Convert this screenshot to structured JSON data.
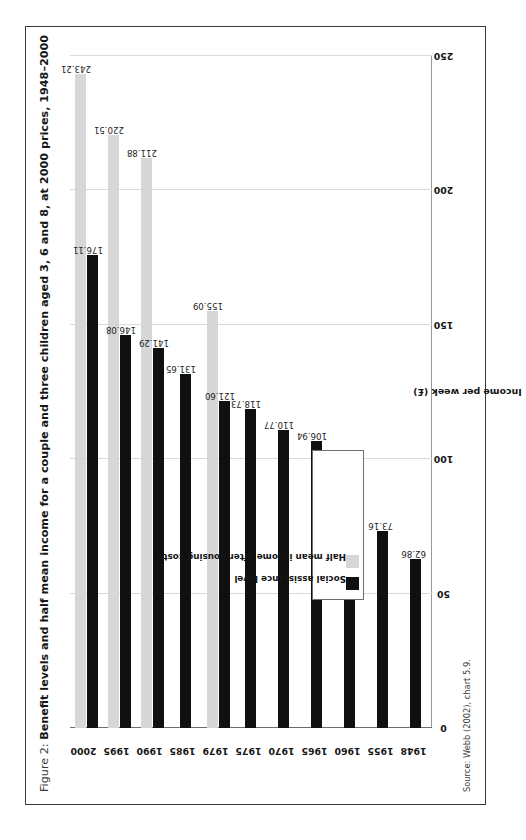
{
  "figure": {
    "label_prefix": "Figure 2: ",
    "title": "Benefit levels and half mean income for a couple and three children aged 3, 6 and 8, at 2000 prices, 1948–2000",
    "full_title": "Figure 2: Benefit levels and half mean income for a couple and three children aged 3, 6 and 8, at 2000 prices, 1948–2000",
    "source": "Source: Webb (2002), chart 5.9."
  },
  "colors": {
    "series_dark": "#101010",
    "series_light": "#d7d7d7",
    "frame_border": "#3a3a3a",
    "axis_line": "#6d6d6d",
    "gridline": "#d9d9d9",
    "text": "#151515",
    "background": "#ffffff"
  },
  "legend": {
    "position": "inside-left",
    "entries": [
      {
        "label": "Social assistance level",
        "swatch": "dark"
      },
      {
        "label": "Half mean income after housing costs",
        "swatch": "light"
      }
    ]
  },
  "chart_data": {
    "type": "bar",
    "orientation": "horizontal-rotated",
    "title": "Figure 2: Benefit levels and half mean income for a couple and three children aged 3, 6 and 8, at 2000 prices, 1948–2000",
    "subtitle": "",
    "xlabel": "",
    "ylabel": "Income per week (£)",
    "ylim": [
      0,
      250
    ],
    "yticks": [
      0,
      50,
      100,
      150,
      200,
      250
    ],
    "ytick_labels": [
      "0",
      "50",
      "100",
      "150",
      "200",
      "250"
    ],
    "grid": true,
    "legend_position": "inside-left",
    "categories": [
      "1948",
      "1955",
      "1960",
      "1965",
      "1970",
      "1975",
      "1979",
      "1985",
      "1990",
      "1995",
      "2000"
    ],
    "series": [
      {
        "name": "Social assistance level",
        "color": "#101010",
        "values": [
          62.86,
          73.16,
          85.12,
          106.94,
          110.77,
          118.73,
          121.6,
          131.65,
          141.29,
          146.08,
          176.11
        ],
        "labels": [
          "62.86",
          "73.16",
          "85.12",
          "106.94",
          "110.77",
          "118.73",
          "121.60",
          "131.65",
          "141.29",
          "146.08",
          "176.11"
        ]
      },
      {
        "name": "Half mean income after housing costs",
        "color": "#d7d7d7",
        "values": [
          null,
          null,
          null,
          null,
          null,
          null,
          155.09,
          null,
          211.88,
          220.51,
          243.21
        ],
        "labels": [
          "",
          "",
          "",
          "",
          "",
          "",
          "155.09",
          "",
          "211.88",
          "220.51",
          "243.21"
        ]
      }
    ],
    "annotations": [
      "Source: Webb (2002), chart 5.9."
    ]
  }
}
